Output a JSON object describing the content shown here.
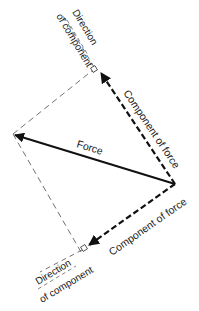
{
  "diagram": {
    "type": "vector-resolution",
    "colors": {
      "ink": "#111111",
      "background": "#ffffff"
    },
    "labels": {
      "force": "Force",
      "component_upper": "Component of force",
      "component_lower": "Component of force",
      "direction_upper_line1": "Direction",
      "direction_upper_line2": "of component",
      "direction_lower_line1": "Direction",
      "direction_lower_line2": "of component"
    }
  }
}
